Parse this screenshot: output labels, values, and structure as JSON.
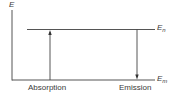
{
  "diagram": {
    "axis_label": "E",
    "levels": [
      {
        "id": "upper",
        "symbol": "E",
        "subscript": "n"
      },
      {
        "id": "lower",
        "symbol": "E",
        "subscript": "m"
      }
    ],
    "transitions": [
      {
        "label": "Absorption",
        "direction": "up",
        "from": "lower",
        "to": "upper"
      },
      {
        "label": "Emission",
        "direction": "down",
        "from": "upper",
        "to": "lower"
      }
    ],
    "colors": {
      "line": "#555555",
      "text": "#3a3a3a",
      "background": "#ffffff"
    }
  }
}
